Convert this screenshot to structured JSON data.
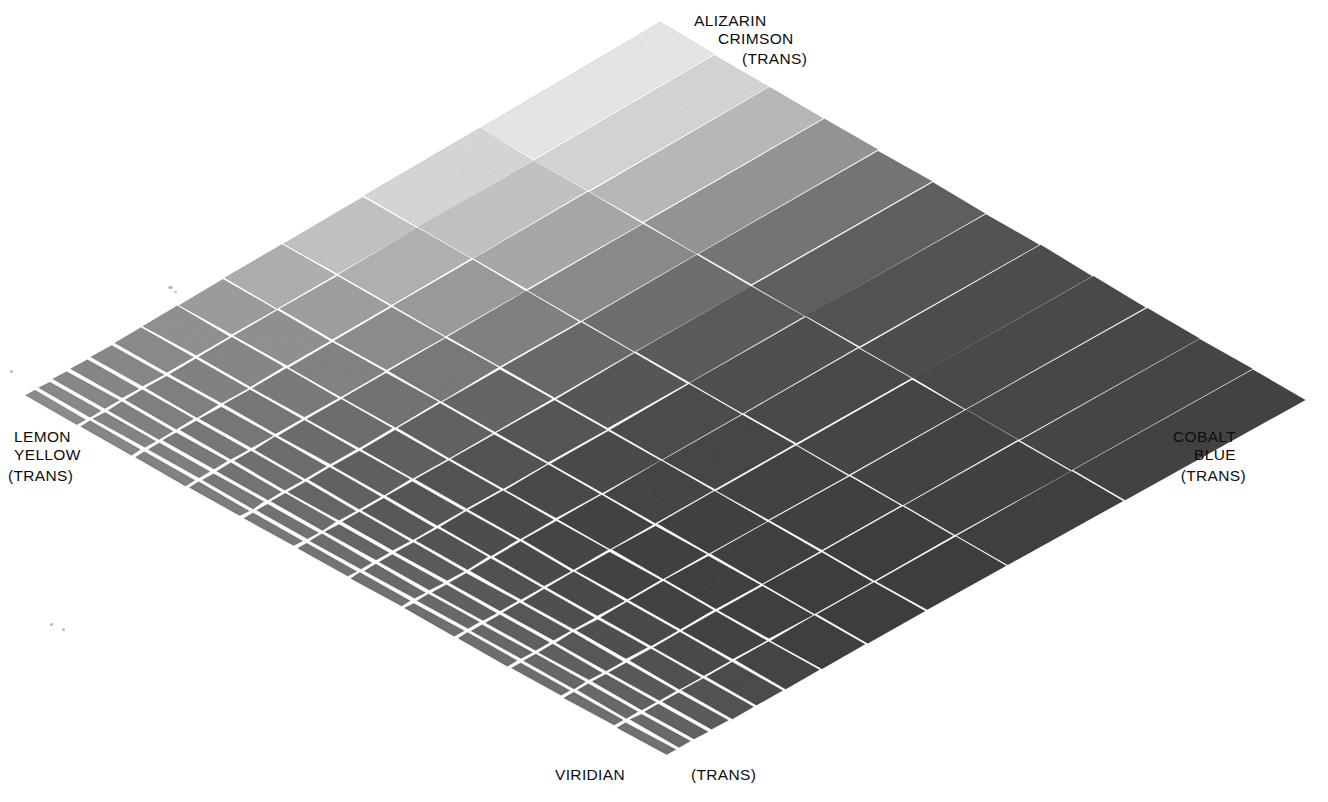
{
  "figure": {
    "kind": "color-mixing-chart",
    "background_color": "#ffffff",
    "grout_color": "#fbfbfb",
    "ink_color": "#0d0d0d"
  },
  "labels": {
    "top": {
      "name": "alizarin-crimson",
      "line1": "ALIZARIN",
      "line2": "CRIMSON",
      "line3": "(TRANS)"
    },
    "left": {
      "name": "lemon-yellow",
      "line1": "LEMON",
      "line2": "YELLOW",
      "line3": "(TRANS)"
    },
    "right": {
      "name": "cobalt-blue",
      "line1": "COBALT",
      "line2": "BLUE",
      "line3": "(TRANS)"
    },
    "bottom": {
      "name": "viridian",
      "line1": "VIRIDIAN",
      "trans": "(TRANS)"
    }
  },
  "chart_data": {
    "type": "heatmap",
    "title": "",
    "xlabel": "",
    "ylabel": "",
    "grid": true,
    "legend_position": "corners",
    "rows": 12,
    "cols": 12,
    "row_axis": "Cobalt Blue (TRANS) → Lemon Yellow (TRANS)",
    "col_axis": "Alizarin Crimson (TRANS) → Viridian (TRANS)",
    "corner_pigments": {
      "top": "ALIZARIN CRIMSON (TRANS)",
      "left": "LEMON YELLOW (TRANS)",
      "right": "COBALT BLUE (TRANS)",
      "bottom": "VIRIDIAN (TRANS)"
    },
    "value_units": "grayscale luminance 0-255",
    "values": [
      [
        232,
        214,
        186,
        150,
        118,
        96,
        84,
        78,
        74,
        72,
        70,
        68
      ],
      [
        216,
        196,
        170,
        140,
        112,
        92,
        80,
        74,
        70,
        68,
        66,
        64
      ],
      [
        196,
        178,
        156,
        130,
        106,
        88,
        77,
        71,
        67,
        65,
        63,
        62
      ],
      [
        176,
        160,
        142,
        122,
        102,
        86,
        75,
        69,
        66,
        64,
        63,
        62
      ],
      [
        158,
        146,
        132,
        116,
        99,
        84,
        74,
        68,
        65,
        64,
        64,
        64
      ],
      [
        146,
        136,
        124,
        111,
        97,
        84,
        75,
        70,
        68,
        68,
        68,
        69
      ],
      [
        140,
        131,
        120,
        109,
        97,
        86,
        79,
        75,
        74,
        74,
        75,
        76
      ],
      [
        137,
        129,
        120,
        110,
        99,
        90,
        85,
        82,
        81,
        81,
        82,
        84
      ],
      [
        136,
        129,
        121,
        113,
        104,
        96,
        92,
        90,
        89,
        89,
        90,
        92
      ],
      [
        137,
        131,
        124,
        117,
        110,
        103,
        100,
        98,
        97,
        97,
        98,
        100
      ],
      [
        139,
        134,
        128,
        122,
        116,
        111,
        108,
        106,
        105,
        105,
        106,
        108
      ],
      [
        142,
        137,
        132,
        127,
        122,
        118,
        115,
        113,
        112,
        112,
        113,
        115
      ]
    ]
  },
  "geometry": {
    "apex": [
      660,
      22
    ],
    "left_tip": [
      22,
      396
    ],
    "right_tip": [
      1306,
      400
    ],
    "bottom_tip": [
      666,
      757
    ],
    "note": "Perspective projection of a 12x12 square grid; top corner of the diamond is the vanishing-point side."
  }
}
